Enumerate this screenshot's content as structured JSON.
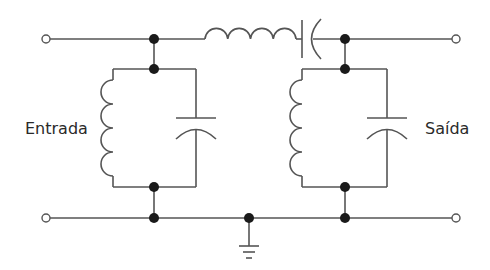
{
  "diagram": {
    "type": "circuit",
    "labels": {
      "input": "Entrada",
      "output": "Saída"
    },
    "components": [
      {
        "id": "L1",
        "kind": "inductor",
        "role": "input-shunt-tank"
      },
      {
        "id": "C1",
        "kind": "capacitor",
        "role": "input-shunt-tank"
      },
      {
        "id": "L2",
        "kind": "inductor",
        "role": "series-arm"
      },
      {
        "id": "C2",
        "kind": "capacitor",
        "role": "series-arm"
      },
      {
        "id": "L3",
        "kind": "inductor",
        "role": "output-shunt-tank"
      },
      {
        "id": "C3",
        "kind": "capacitor",
        "role": "output-shunt-tank"
      },
      {
        "id": "GND",
        "kind": "ground",
        "role": "common-return"
      }
    ],
    "colors": {
      "wire": "#555555",
      "node": "#1a1a1a",
      "background": "#ffffff"
    }
  }
}
